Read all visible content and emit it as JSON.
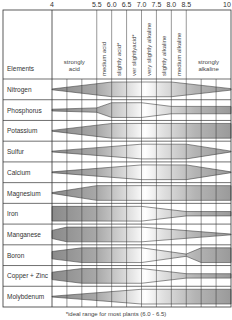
{
  "chart_data": {
    "type": "table",
    "title": "",
    "x_axis": {
      "label": "pH",
      "tick_labels": [
        "4",
        "5.5",
        "6.0",
        "6.5",
        "7.0",
        "7.5",
        "8.0",
        "8.5",
        "10"
      ],
      "range": [
        4,
        10
      ]
    },
    "column_header": "Elements",
    "ph_zones": [
      {
        "label": "strongly acid",
        "from": 4,
        "to": 5.5,
        "orientation": "horizontal"
      },
      {
        "label": "medium acid",
        "from": 5.5,
        "to": 6.0,
        "orientation": "vertical"
      },
      {
        "label": "slightly acid*",
        "from": 6.0,
        "to": 6.5,
        "orientation": "vertical"
      },
      {
        "label": "ver slightlyacid*",
        "from": 6.5,
        "to": 7.0,
        "orientation": "vertical"
      },
      {
        "label": "very slightly alkaline",
        "from": 7.0,
        "to": 7.5,
        "orientation": "vertical"
      },
      {
        "label": "slightly alkaline",
        "from": 7.5,
        "to": 8.0,
        "orientation": "vertical"
      },
      {
        "label": "medium alkaline",
        "from": 8.0,
        "to": 8.5,
        "orientation": "vertical"
      },
      {
        "label": "strongly alkaline",
        "from": 8.5,
        "to": 10,
        "orientation": "horizontal"
      }
    ],
    "series_note": "Band thickness = relative nutrient availability (0-1) at grid columns 0..12 (column 0 = pH 4, 3 = 5.5, 4 = 6.0, 5 = 6.5, 6 = 7.0, 7 = 7.5, 8 = 8.0, 9 = 8.5, 12 = 10)",
    "series": [
      {
        "name": "Nitrogen",
        "availability": [
          [
            0,
            0
          ],
          [
            4,
            1
          ],
          [
            8,
            1
          ],
          [
            12,
            0.1
          ]
        ]
      },
      {
        "name": "Phosphorus",
        "availability": [
          [
            0,
            0.12
          ],
          [
            3,
            0.3
          ],
          [
            4,
            1
          ],
          [
            6,
            1
          ],
          [
            8,
            0.5
          ],
          [
            12,
            0.5
          ]
        ]
      },
      {
        "name": "Potassium",
        "availability": [
          [
            0,
            0
          ],
          [
            4,
            1
          ],
          [
            12,
            1
          ]
        ]
      },
      {
        "name": "Sulfur",
        "availability": [
          [
            0,
            0
          ],
          [
            6,
            1
          ],
          [
            9,
            1
          ],
          [
            12,
            0
          ]
        ]
      },
      {
        "name": "Calcium",
        "availability": [
          [
            0,
            0
          ],
          [
            6,
            1
          ],
          [
            9,
            1
          ],
          [
            12,
            0
          ]
        ]
      },
      {
        "name": "Magnesium",
        "availability": [
          [
            0,
            0
          ],
          [
            3,
            1
          ],
          [
            12,
            1
          ]
        ]
      },
      {
        "name": "Iron",
        "availability": [
          [
            0,
            1
          ],
          [
            6,
            1
          ],
          [
            9,
            0.3
          ],
          [
            12,
            0.3
          ]
        ]
      },
      {
        "name": "Manganese",
        "availability": [
          [
            0,
            0.55
          ],
          [
            1,
            1
          ],
          [
            6,
            1
          ],
          [
            12,
            0
          ]
        ]
      },
      {
        "name": "Boron",
        "availability": [
          [
            0,
            0.5
          ],
          [
            2,
            1
          ],
          [
            6,
            1
          ],
          [
            9,
            0.15
          ],
          [
            10,
            1
          ],
          [
            12,
            1
          ]
        ]
      },
      {
        "name": "Copper + Zinc",
        "availability": [
          [
            0,
            0.5
          ],
          [
            2,
            1
          ],
          [
            6,
            1
          ],
          [
            9,
            0.3
          ],
          [
            12,
            0.3
          ]
        ]
      },
      {
        "name": "Molybdenum",
        "availability": [
          [
            0,
            0
          ],
          [
            6,
            1
          ],
          [
            12,
            1
          ]
        ]
      }
    ],
    "footnote": "*ideal range for most plants (6.0 - 6.5)",
    "grid": true,
    "colors": {
      "band_dark": "#8c8c8c",
      "band_light": "#f4f4f4",
      "band_stroke": "#444444",
      "grid": "#333333"
    }
  }
}
